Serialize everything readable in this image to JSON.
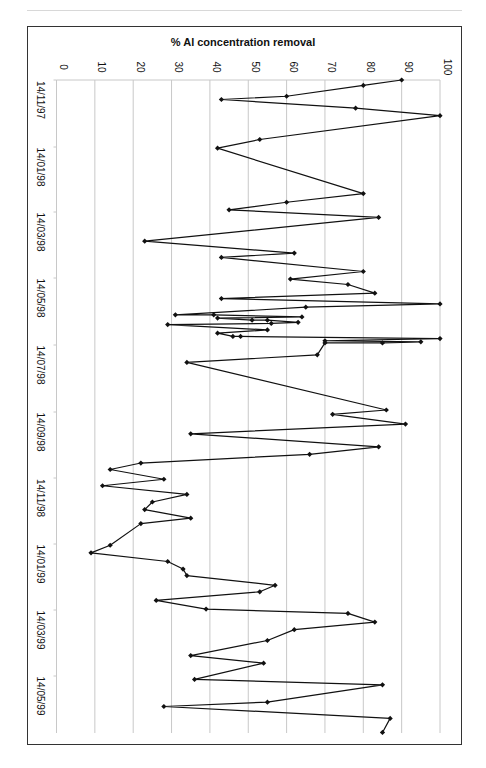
{
  "chart_data": {
    "type": "line",
    "orientation": "rotated-90-clockwise",
    "title": "% Al concentration removal",
    "xlabel": "",
    "ylabel": "% Al concentration removal",
    "ylim": [
      0,
      100
    ],
    "y_ticks": [
      0,
      10,
      20,
      30,
      40,
      50,
      60,
      70,
      80,
      90,
      100
    ],
    "x_tick_labels": [
      "14/11/97",
      "14/01/98",
      "14/03/98",
      "14/05/98",
      "14/07/98",
      "14/09/98",
      "14/11/98",
      "14/01/99",
      "14/03/99",
      "14/05/99"
    ],
    "grid": "vertical lines at each value tick (light gray)",
    "legend": "none",
    "marker": "diamond",
    "series": [
      {
        "name": "% Al concentration removal",
        "points": [
          {
            "date": "14/11/97",
            "day": 0,
            "value": 90
          },
          {
            "date": "19/11/97",
            "day": 5,
            "value": 80
          },
          {
            "date": "29/11/97",
            "day": 15,
            "value": 60
          },
          {
            "date": "02/12/97",
            "day": 18,
            "value": 43
          },
          {
            "date": "10/12/97",
            "day": 26,
            "value": 78
          },
          {
            "date": "17/12/97",
            "day": 33,
            "value": 100
          },
          {
            "date": "08/01/98",
            "day": 55,
            "value": 53
          },
          {
            "date": "16/01/98",
            "day": 63,
            "value": 42
          },
          {
            "date": "27/02/98",
            "day": 105,
            "value": 80
          },
          {
            "date": "07/03/98",
            "day": 113,
            "value": 60
          },
          {
            "date": "14/03/98",
            "day": 120,
            "value": 45
          },
          {
            "date": "21/03/98",
            "day": 127,
            "value": 84
          },
          {
            "date": "12/04/98",
            "day": 149,
            "value": 23
          },
          {
            "date": "23/04/98",
            "day": 160,
            "value": 62
          },
          {
            "date": "27/04/98",
            "day": 164,
            "value": 43
          },
          {
            "date": "10/05/98",
            "day": 177,
            "value": 80
          },
          {
            "date": "17/05/98",
            "day": 184,
            "value": 61
          },
          {
            "date": "22/05/98",
            "day": 189,
            "value": 76
          },
          {
            "date": "30/05/98",
            "day": 197,
            "value": 83
          },
          {
            "date": "04/06/98",
            "day": 202,
            "value": 43
          },
          {
            "date": "09/06/98",
            "day": 207,
            "value": 100
          },
          {
            "date": "12/06/98",
            "day": 210,
            "value": 65
          },
          {
            "date": "19/06/98",
            "day": 217,
            "value": 31
          },
          {
            "date": "19/06/98",
            "day": 217,
            "value": 41
          },
          {
            "date": "21/06/98",
            "day": 219,
            "value": 64
          },
          {
            "date": "22/06/98",
            "day": 220,
            "value": 42
          },
          {
            "date": "24/06/98",
            "day": 222,
            "value": 51
          },
          {
            "date": "24/06/98",
            "day": 222,
            "value": 55
          },
          {
            "date": "26/06/98",
            "day": 224,
            "value": 63
          },
          {
            "date": "27/06/98",
            "day": 225,
            "value": 56
          },
          {
            "date": "28/06/98",
            "day": 226,
            "value": 29
          },
          {
            "date": "03/07/98",
            "day": 231,
            "value": 55
          },
          {
            "date": "06/07/98",
            "day": 234,
            "value": 42
          },
          {
            "date": "09/07/98",
            "day": 237,
            "value": 46
          },
          {
            "date": "09/07/98",
            "day": 237,
            "value": 48
          },
          {
            "date": "11/07/98",
            "day": 239,
            "value": 100
          },
          {
            "date": "13/07/98",
            "day": 241,
            "value": 70
          },
          {
            "date": "14/07/98",
            "day": 242,
            "value": 95
          },
          {
            "date": "15/07/98",
            "day": 243,
            "value": 85
          },
          {
            "date": "15/07/98",
            "day": 243,
            "value": 70
          },
          {
            "date": "26/07/98",
            "day": 254,
            "value": 68
          },
          {
            "date": "02/08/98",
            "day": 261,
            "value": 34
          },
          {
            "date": "15/09/98",
            "day": 305,
            "value": 86
          },
          {
            "date": "19/09/98",
            "day": 309,
            "value": 72
          },
          {
            "date": "28/09/98",
            "day": 318,
            "value": 91
          },
          {
            "date": "07/10/98",
            "day": 327,
            "value": 35
          },
          {
            "date": "19/10/98",
            "day": 339,
            "value": 84
          },
          {
            "date": "26/10/98",
            "day": 346,
            "value": 66
          },
          {
            "date": "03/11/98",
            "day": 354,
            "value": 22
          },
          {
            "date": "09/11/98",
            "day": 360,
            "value": 14
          },
          {
            "date": "18/11/98",
            "day": 369,
            "value": 28
          },
          {
            "date": "24/11/98",
            "day": 375,
            "value": 12
          },
          {
            "date": "02/12/98",
            "day": 383,
            "value": 34
          },
          {
            "date": "09/12/98",
            "day": 390,
            "value": 25
          },
          {
            "date": "16/12/98",
            "day": 397,
            "value": 23
          },
          {
            "date": "24/12/98",
            "day": 405,
            "value": 35
          },
          {
            "date": "29/12/98",
            "day": 410,
            "value": 22
          },
          {
            "date": "18/01/99",
            "day": 430,
            "value": 14
          },
          {
            "date": "25/01/99",
            "day": 437,
            "value": 9
          },
          {
            "date": "02/02/99",
            "day": 445,
            "value": 29
          },
          {
            "date": "09/02/99",
            "day": 452,
            "value": 33
          },
          {
            "date": "15/02/99",
            "day": 458,
            "value": 34
          },
          {
            "date": "24/02/99",
            "day": 467,
            "value": 57
          },
          {
            "date": "02/03/99",
            "day": 473,
            "value": 53
          },
          {
            "date": "10/03/99",
            "day": 481,
            "value": 26
          },
          {
            "date": "18/03/99",
            "day": 489,
            "value": 39
          },
          {
            "date": "22/03/99",
            "day": 493,
            "value": 76
          },
          {
            "date": "30/03/99",
            "day": 501,
            "value": 83
          },
          {
            "date": "06/04/99",
            "day": 508,
            "value": 62
          },
          {
            "date": "16/04/99",
            "day": 518,
            "value": 55
          },
          {
            "date": "30/04/99",
            "day": 532,
            "value": 35
          },
          {
            "date": "07/05/99",
            "day": 539,
            "value": 54
          },
          {
            "date": "22/05/99",
            "day": 554,
            "value": 36
          },
          {
            "date": "27/05/99",
            "day": 559,
            "value": 85
          },
          {
            "date": "12/06/99",
            "day": 575,
            "value": 55
          },
          {
            "date": "16/06/99",
            "day": 579,
            "value": 28
          },
          {
            "date": "27/06/99",
            "day": 590,
            "value": 87
          },
          {
            "date": "10/07/99",
            "day": 603,
            "value": 85
          }
        ]
      }
    ]
  },
  "colors": {
    "line": "#111111",
    "marker": "#111111",
    "grid": "#c8c8c8",
    "frame": "#333333",
    "top_rule": "#d8d8d8"
  }
}
